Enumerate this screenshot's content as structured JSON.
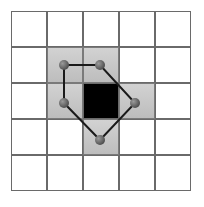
{
  "diagram": {
    "title": "",
    "grid": {
      "rows": 5,
      "cols": 5,
      "origin": [
        11,
        11
      ],
      "cell_size": 35.5,
      "cell_gap": 0.5,
      "cell_border_color": "#6a6a6a",
      "empty_color": "#ffffff",
      "neighbor_color": "#c6c6c6",
      "center_color": "#000000"
    },
    "center_cell": [
      2,
      2
    ],
    "shaded_cells": [
      [
        1,
        1
      ],
      [
        1,
        2
      ],
      [
        2,
        1
      ],
      [
        2,
        3
      ],
      [
        3,
        2
      ]
    ],
    "polygon": {
      "stroke_color": "#1a1a1a",
      "node_color": "#5a5a5a",
      "points": [
        [
          64,
          65
        ],
        [
          100,
          65
        ],
        [
          135,
          103
        ],
        [
          100,
          140
        ],
        [
          64,
          103
        ]
      ]
    }
  }
}
